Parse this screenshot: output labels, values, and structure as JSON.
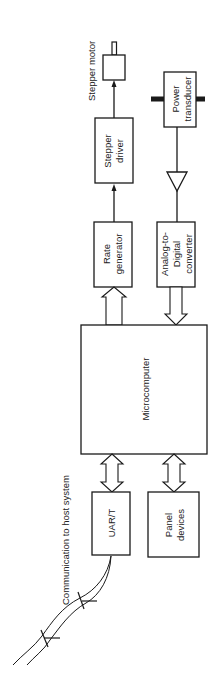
{
  "diagram": {
    "type": "block-diagram",
    "orientation": "rotated-90-ccw",
    "blocks": {
      "stepper_motor": {
        "label": "Stepper motor"
      },
      "stepper_driver": {
        "line1": "Stepper",
        "line2": "driver"
      },
      "rate_generator": {
        "line1": "Rate",
        "line2": "generator"
      },
      "power_transducer": {
        "line1": "Power",
        "line2": "transducer"
      },
      "adc": {
        "line1": "Analog-to-",
        "line2": "Digital",
        "line3": "converter"
      },
      "microcomputer": {
        "label": "Microcomputer"
      },
      "uart": {
        "label": "UAR/T"
      },
      "panel_devices": {
        "line1": "Panel",
        "line2": "devices"
      }
    },
    "annotations": {
      "communication": "Communication to host system"
    },
    "connections": [
      {
        "from": "Stepper driver",
        "to": "Stepper motor",
        "kind": "line-arrow"
      },
      {
        "from": "Rate generator",
        "to": "Stepper driver",
        "kind": "line-arrow"
      },
      {
        "from": "Microcomputer",
        "to": "Rate generator",
        "kind": "bus-arrow"
      },
      {
        "from": "Power transducer",
        "to": "Analog-to-Digital converter",
        "kind": "line-via-amplifier"
      },
      {
        "from": "Analog-to-Digital converter",
        "to": "Microcomputer",
        "kind": "bus-arrow"
      },
      {
        "from": "Microcomputer",
        "to": "UAR/T",
        "kind": "bidirectional-bus"
      },
      {
        "from": "Microcomputer",
        "to": "Panel devices",
        "kind": "bidirectional-bus"
      },
      {
        "from": "UAR/T",
        "to": "host system",
        "kind": "cable"
      }
    ],
    "colors": {
      "stroke": "#1a1a1a",
      "background": "#ffffff"
    }
  }
}
